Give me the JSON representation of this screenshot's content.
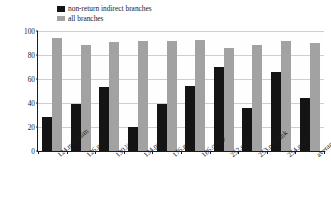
{
  "chart_data": {
    "type": "bar",
    "title": "",
    "xlabel": "",
    "ylabel": "accuracy (%)",
    "ylim": [
      0,
      100
    ],
    "yticks": [
      0,
      20,
      40,
      60,
      80,
      100
    ],
    "ytick_labels": [
      "0",
      "20",
      "40",
      "60",
      "80",
      "100"
    ],
    "grid": true,
    "legend_position": "top-left",
    "categories": [
      "124.m88ksim",
      "126.gcc",
      "130.li",
      "134.perl",
      "176.gcc",
      "186.crafty",
      "252.eon",
      "253.perlbmk",
      "254.gap",
      "average"
    ],
    "series": [
      {
        "name": "non-return indirect branches",
        "color": "#141414",
        "values": [
          28,
          39,
          53,
          20,
          39,
          54.5,
          70,
          35.5,
          66,
          44
        ]
      },
      {
        "name": "all branches",
        "color": "#a2a2a2",
        "values": [
          94,
          88.5,
          91,
          92,
          92,
          92.5,
          86,
          88,
          91.5,
          90
        ]
      }
    ]
  }
}
